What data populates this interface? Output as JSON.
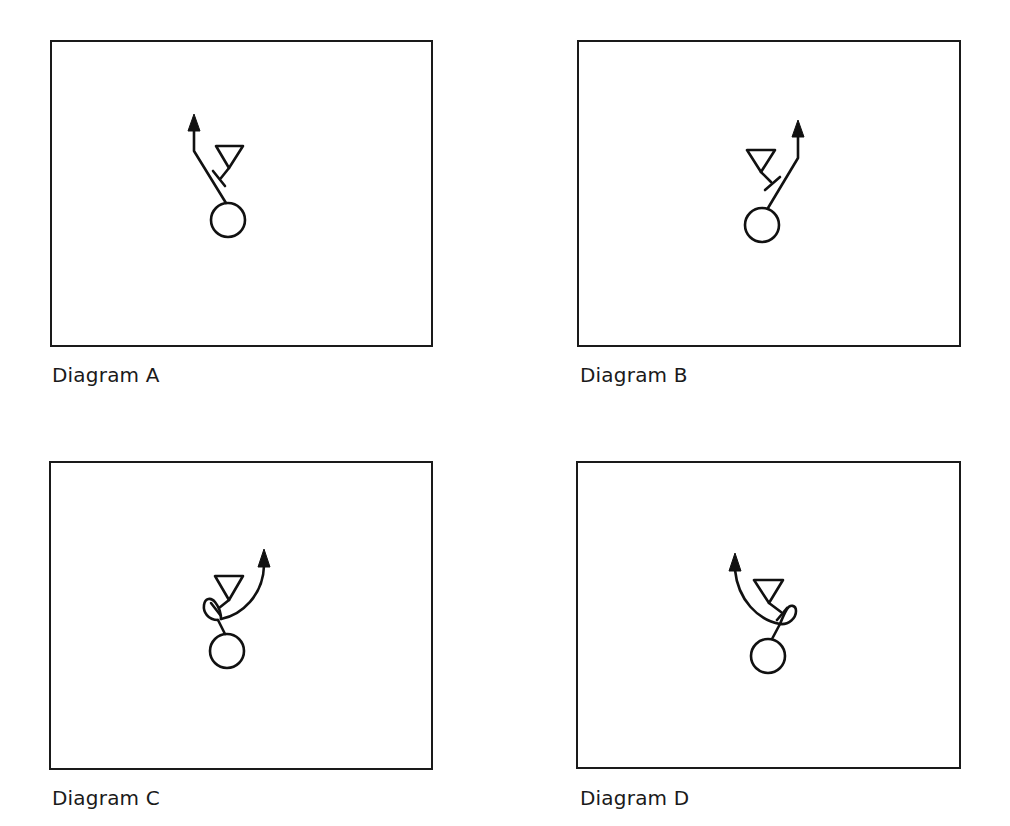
{
  "figure": {
    "panels": [
      {
        "id": "A",
        "label": "Diagram A",
        "move": "straight release, then vertical run, to the player's left of the defender"
      },
      {
        "id": "B",
        "label": "Diagram B",
        "move": "straight release, then vertical run, to the player's right of the defender"
      },
      {
        "id": "C",
        "label": "Diagram C",
        "move": "looping spin move, then curved run up and to the right"
      },
      {
        "id": "D",
        "label": "Diagram D",
        "move": "looping spin move, then curved run up and to the left"
      }
    ],
    "legend_symbols": {
      "player": "circle",
      "defender": "downward-triangle",
      "block": "T-bar",
      "route": "arrow"
    },
    "colors": {
      "line": "#111111",
      "background": "#ffffff",
      "frame": "#1a1a1a"
    }
  }
}
